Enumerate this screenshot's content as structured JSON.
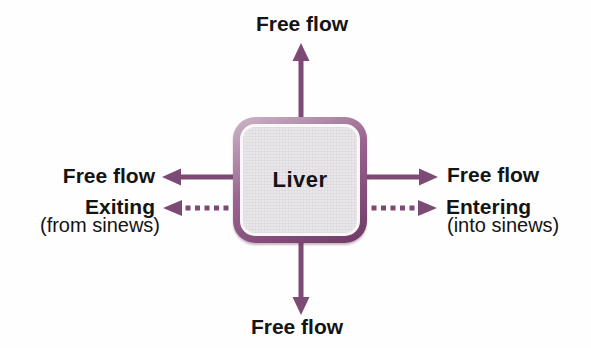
{
  "diagram": {
    "center_box": {
      "label": "Liver"
    },
    "arrows": {
      "top": {
        "label": "Free flow",
        "style": "solid",
        "direction": "up"
      },
      "bottom": {
        "label": "Free flow",
        "style": "solid",
        "direction": "down"
      },
      "left_solid": {
        "label": "Free flow",
        "style": "solid",
        "direction": "left"
      },
      "right_solid": {
        "label": "Free flow",
        "style": "solid",
        "direction": "right"
      },
      "left_dashed": {
        "label": "Exiting",
        "sublabel": "(from sinews)",
        "style": "dashed",
        "direction": "left"
      },
      "right_dashed": {
        "label": "Entering",
        "sublabel": "(into sinews)",
        "style": "dashed",
        "direction": "right"
      }
    },
    "colors": {
      "arrow": "#7d4a75",
      "box_border_light": "#cdb6c8",
      "box_border_dark": "#6e3a63",
      "box_fill": "#e9e7ea",
      "text": "#141414",
      "background": "#fefefe"
    }
  }
}
